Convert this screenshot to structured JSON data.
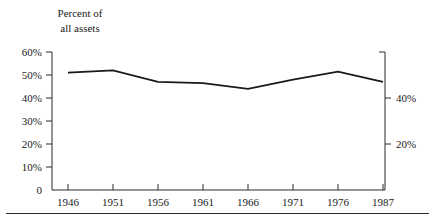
{
  "chart_data": {
    "type": "line",
    "title": "Percent of all assets",
    "title_lines": [
      "Percent of",
      "all assets"
    ],
    "xlabel": "",
    "ylabel": "",
    "x": [
      "1946",
      "1951",
      "1956",
      "1961",
      "1966",
      "1971",
      "1976",
      "1987"
    ],
    "values": [
      51,
      52,
      47,
      46.5,
      44,
      48,
      51.5,
      47
    ],
    "series": [
      {
        "name": "Percent of all assets",
        "values": [
          51,
          52,
          47,
          46.5,
          44,
          48,
          51.5,
          47
        ]
      }
    ],
    "ylim": [
      0,
      60
    ],
    "left_axis": {
      "ticks": [
        "0",
        "10%",
        "20%",
        "30%",
        "40%",
        "50%",
        "60%"
      ],
      "tick_values": [
        0,
        10,
        20,
        30,
        40,
        50,
        60
      ]
    },
    "right_axis": {
      "ticks": [
        "20%",
        "40%"
      ],
      "tick_values": [
        20,
        40
      ]
    },
    "grid": false,
    "legend": "none",
    "line_color": "#1a1a1a"
  }
}
